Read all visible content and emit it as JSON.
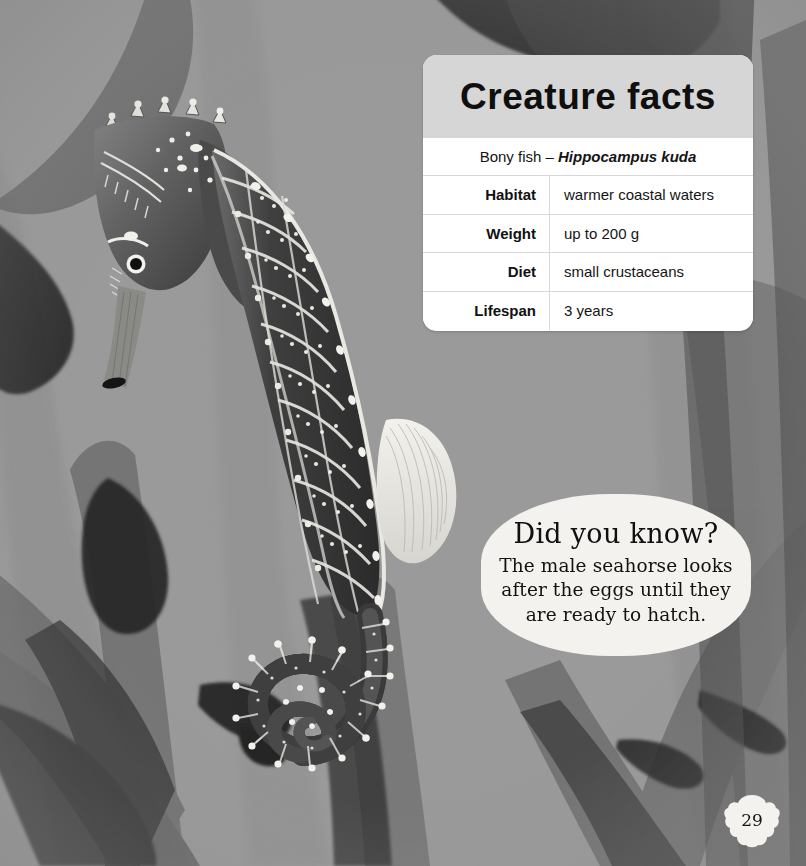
{
  "page": {
    "background_color": "#9a9a9a",
    "number": "29",
    "badge_shape": "scallop-shell"
  },
  "facts_card": {
    "title": "Creature facts",
    "subtitle_prefix": "Bony fish – ",
    "subtitle_scientific_name": "Hippocampus kuda",
    "header_bg": "#d6d6d6",
    "body_bg": "#ffffff",
    "rows": [
      {
        "label": "Habitat",
        "value": "warmer coastal waters"
      },
      {
        "label": "Weight",
        "value": "up to 200 g"
      },
      {
        "label": "Diet",
        "value": "small crustaceans"
      },
      {
        "label": "Lifespan",
        "value": "3 years"
      }
    ]
  },
  "did_you_know": {
    "heading": "Did you know?",
    "line1": "The male seahorse looks",
    "line2": "after the eggs until they",
    "line3": "are ready to hatch.",
    "bubble_color": "#f4f2ee"
  },
  "illustration": {
    "subject": "seahorse",
    "description": "Grayscale scientific illustration of a Hippocampus kuda seahorse with armored body plates, white dots, dorsal fin and coiled tail",
    "background_elements": "translucent watercolour seaweed / kelp fronds",
    "palette": {
      "water": "#9a9a9a",
      "seaweed_light": "#8d8d8d",
      "seaweed_mid": "#6f6f6f",
      "seaweed_dark": "#3c3c3c",
      "seaweed_darkest": "#232323",
      "creature_body": "#4a4a4a",
      "creature_highlight": "#e8e8e4"
    }
  }
}
